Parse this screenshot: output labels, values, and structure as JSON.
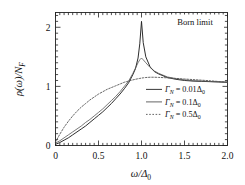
{
  "chart_data": {
    "type": "line",
    "title": "",
    "annotation": "Born limit",
    "xlabel": "ω/Δ₀",
    "ylabel": "ρ(ω)/N_F",
    "xlim": [
      0,
      2.0
    ],
    "ylim": [
      0,
      2.25
    ],
    "grid": false,
    "legend_position": "center-right",
    "xticks": [
      0,
      0.5,
      1.0,
      1.5,
      2.0
    ],
    "xticklabels": [
      "0",
      "0.5",
      "1.0",
      "1.5",
      "2.0"
    ],
    "yticks": [
      0,
      1,
      2
    ],
    "yticklabels": [
      "0",
      "1",
      "2"
    ],
    "x": [
      0.0,
      0.05,
      0.1,
      0.15,
      0.2,
      0.25,
      0.3,
      0.35,
      0.4,
      0.45,
      0.5,
      0.55,
      0.6,
      0.65,
      0.7,
      0.75,
      0.8,
      0.85,
      0.9,
      0.93,
      0.96,
      0.98,
      1.0,
      1.02,
      1.05,
      1.1,
      1.15,
      1.2,
      1.3,
      1.4,
      1.5,
      1.6,
      1.7,
      1.8,
      1.9,
      2.0
    ],
    "series": [
      {
        "name": "Γ_N = 0.01Δ₀",
        "style": "solid",
        "color": "#222222",
        "values": [
          0.02,
          0.05,
          0.09,
          0.13,
          0.18,
          0.23,
          0.28,
          0.33,
          0.39,
          0.45,
          0.51,
          0.57,
          0.64,
          0.71,
          0.79,
          0.87,
          0.96,
          1.06,
          1.2,
          1.3,
          1.48,
          1.72,
          2.1,
          1.74,
          1.5,
          1.33,
          1.25,
          1.21,
          1.15,
          1.12,
          1.1,
          1.09,
          1.085,
          1.08,
          1.075,
          1.07
        ]
      },
      {
        "name": "Γ_N = 0.1Δ₀",
        "style": "solid",
        "color": "#555555",
        "values": [
          0.04,
          0.08,
          0.13,
          0.18,
          0.23,
          0.28,
          0.33,
          0.39,
          0.44,
          0.5,
          0.56,
          0.62,
          0.69,
          0.76,
          0.83,
          0.91,
          1.0,
          1.09,
          1.22,
          1.31,
          1.4,
          1.45,
          1.48,
          1.45,
          1.4,
          1.32,
          1.26,
          1.22,
          1.16,
          1.13,
          1.11,
          1.095,
          1.088,
          1.082,
          1.076,
          1.07
        ]
      },
      {
        "name": "Γ_N = 0.5Δ₀",
        "style": "dotted",
        "color": "#555555",
        "values": [
          0.06,
          0.19,
          0.31,
          0.41,
          0.5,
          0.58,
          0.65,
          0.71,
          0.77,
          0.82,
          0.87,
          0.91,
          0.95,
          0.98,
          1.01,
          1.04,
          1.07,
          1.09,
          1.11,
          1.12,
          1.13,
          1.135,
          1.14,
          1.145,
          1.15,
          1.155,
          1.155,
          1.152,
          1.145,
          1.135,
          1.125,
          1.115,
          1.105,
          1.095,
          1.082,
          1.07
        ]
      }
    ]
  },
  "legend": {
    "items": [
      {
        "label_gamma": "Γ",
        "label_sub": "N",
        "label_eq": " = 0.01Δ",
        "label_eq_sub": "0",
        "style": "solid"
      },
      {
        "label_gamma": "Γ",
        "label_sub": "N",
        "label_eq": " = 0.1Δ",
        "label_eq_sub": "0",
        "style": "solid"
      },
      {
        "label_gamma": "Γ",
        "label_sub": "N",
        "label_eq": " = 0.5Δ",
        "label_eq_sub": "0",
        "style": "dotted"
      }
    ]
  },
  "axes": {
    "ylabel_rho": "ρ(ω)/N",
    "ylabel_sub": "F",
    "xlabel_omega": "ω/Δ",
    "xlabel_sub": "0"
  },
  "annotation": {
    "text": "Born limit"
  },
  "colors": {
    "frame": "#222222",
    "curve_sharp": "#222222",
    "curve_mid": "#555555",
    "curve_dotted": "#555555",
    "background": "#ffffff"
  }
}
